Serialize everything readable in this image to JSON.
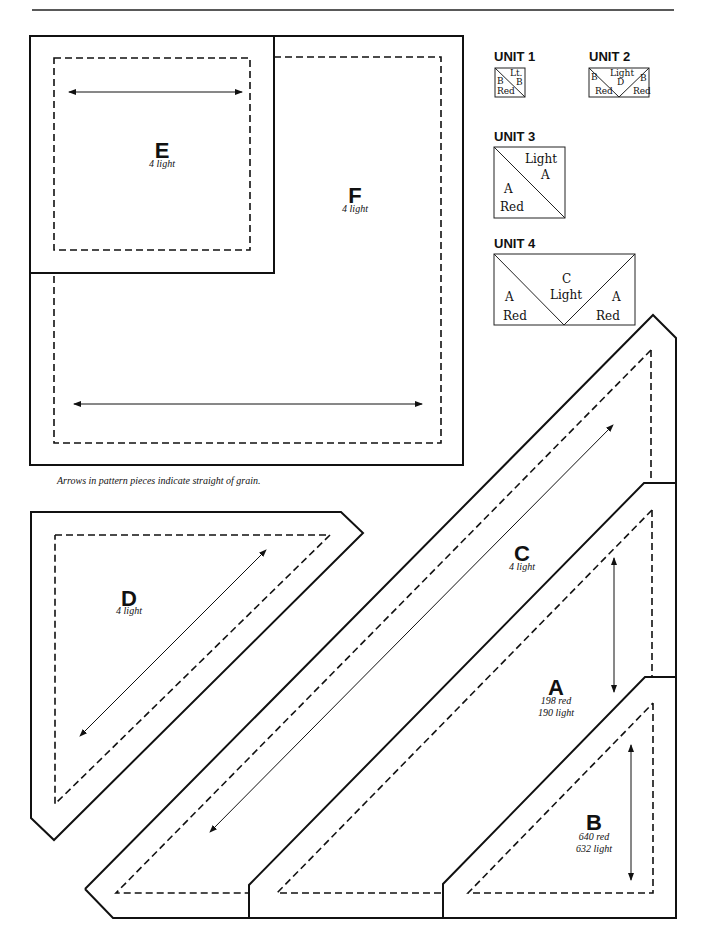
{
  "header": {
    "text": ""
  },
  "caption": "Arrows in pattern pieces indicate straight of grain.",
  "pieces": {
    "E": {
      "letter": "E",
      "qty": "4 light"
    },
    "F": {
      "letter": "F",
      "qty": "4 light"
    },
    "D": {
      "letter": "D",
      "qty": "4 light"
    },
    "C": {
      "letter": "C",
      "qty": "4 light"
    },
    "A": {
      "letter": "A",
      "qty1": "198 red",
      "qty2": "190 light"
    },
    "B": {
      "letter": "B",
      "qty1": "640 red",
      "qty2": "632 light"
    }
  },
  "units": [
    {
      "title": "UNIT 1",
      "labels": {
        "top": "Lt.",
        "right": "B",
        "left": "B",
        "bottom": "Red"
      }
    },
    {
      "title": "UNIT 2",
      "labels": {
        "center_top": "Light",
        "center": "D",
        "left": "B",
        "left_bottom": "Red",
        "right": "B",
        "right_bottom": "Red"
      }
    },
    {
      "title": "UNIT 3",
      "labels": {
        "top": "Light",
        "top_letter": "A",
        "left_letter": "A",
        "bottom": "Red"
      }
    },
    {
      "title": "UNIT 4",
      "labels": {
        "center_letter": "C",
        "center": "Light",
        "left_letter": "A",
        "left_bottom": "Red",
        "right_letter": "A",
        "right_bottom": "Red"
      }
    }
  ],
  "colors": {
    "line": "#111111",
    "background": "#ffffff"
  }
}
